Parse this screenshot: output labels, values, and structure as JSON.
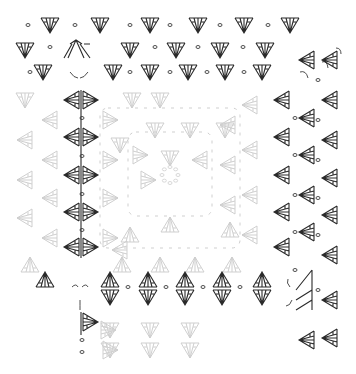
{
  "title": "",
  "chart_type": "crochet-symbol-chart",
  "symbols": {
    "shell_down": "double-crochet fan (∇ with posts)",
    "shell_up": "double-crochet fan (∆ with posts)",
    "shell_left": "fan pointing left (◁)",
    "shell_right": "fan pointing right (▷)",
    "chain": "chain stitch (small oval)",
    "cluster": "split cluster (/⋀\\)"
  },
  "colors": {
    "active": "#2a2a2a",
    "ghost": "#cfcfcf",
    "background": "#ffffff"
  },
  "glyphs": {
    "dark_down": [
      [
        50,
        25
      ],
      [
        100,
        25
      ],
      [
        150,
        25
      ],
      [
        198,
        25
      ],
      [
        244,
        25
      ],
      [
        290,
        25
      ],
      [
        25,
        50
      ],
      [
        130,
        50
      ],
      [
        176,
        50
      ],
      [
        220,
        50
      ],
      [
        265,
        50
      ],
      [
        43,
        72
      ],
      [
        113,
        72
      ],
      [
        150,
        72
      ],
      [
        188,
        72
      ],
      [
        225,
        72
      ],
      [
        262,
        72
      ],
      [
        110,
        297
      ],
      [
        148,
        297
      ],
      [
        185,
        297
      ],
      [
        222,
        297
      ],
      [
        262,
        297
      ]
    ],
    "dark_up": [
      [
        45,
        280
      ],
      [
        110,
        280
      ],
      [
        148,
        280
      ],
      [
        185,
        280
      ],
      [
        222,
        280
      ],
      [
        262,
        280
      ]
    ],
    "dark_left": [
      [
        72,
        100
      ],
      [
        72,
        137
      ],
      [
        72,
        175
      ],
      [
        72,
        212
      ],
      [
        72,
        247
      ],
      [
        282,
        100
      ],
      [
        282,
        137
      ],
      [
        282,
        175
      ],
      [
        282,
        212
      ],
      [
        282,
        247
      ],
      [
        307,
        60
      ],
      [
        307,
        118
      ],
      [
        307,
        155
      ],
      [
        307,
        195
      ],
      [
        307,
        232
      ],
      [
        307,
        340
      ],
      [
        330,
        60
      ],
      [
        330,
        100
      ],
      [
        330,
        140
      ],
      [
        330,
        178
      ],
      [
        330,
        215
      ],
      [
        330,
        255
      ],
      [
        330,
        300
      ],
      [
        330,
        338
      ]
    ],
    "dark_right": [
      [
        90,
        100
      ],
      [
        90,
        137
      ],
      [
        90,
        175
      ],
      [
        90,
        212
      ],
      [
        90,
        247
      ],
      [
        90,
        322
      ]
    ],
    "dark_dots": [
      [
        28,
        25
      ],
      [
        75,
        25
      ],
      [
        130,
        25
      ],
      [
        170,
        25
      ],
      [
        220,
        25
      ],
      [
        268,
        25
      ],
      [
        50,
        47
      ],
      [
        155,
        47
      ],
      [
        198,
        47
      ],
      [
        243,
        47
      ],
      [
        30,
        72
      ],
      [
        130,
        72
      ],
      [
        170,
        72
      ],
      [
        207,
        72
      ],
      [
        244,
        72
      ],
      [
        82,
        118
      ],
      [
        82,
        156
      ],
      [
        82,
        194
      ],
      [
        82,
        230
      ],
      [
        128,
        287
      ],
      [
        166,
        287
      ],
      [
        203,
        287
      ],
      [
        240,
        287
      ],
      [
        295,
        118
      ],
      [
        295,
        155
      ],
      [
        295,
        195
      ],
      [
        295,
        232
      ],
      [
        295,
        270
      ],
      [
        318,
        80
      ],
      [
        318,
        120
      ],
      [
        318,
        160
      ],
      [
        318,
        198
      ],
      [
        318,
        235
      ],
      [
        318,
        290
      ],
      [
        82,
        340
      ],
      [
        82,
        352
      ]
    ],
    "faint_down": [
      [
        25,
        100
      ],
      [
        132,
        100
      ],
      [
        160,
        100
      ],
      [
        120,
        145
      ],
      [
        155,
        130
      ],
      [
        190,
        130
      ],
      [
        225,
        130
      ],
      [
        170,
        158
      ],
      [
        110,
        350
      ],
      [
        150,
        350
      ],
      [
        190,
        350
      ],
      [
        110,
        330
      ],
      [
        150,
        330
      ],
      [
        190,
        330
      ]
    ],
    "faint_up": [
      [
        30,
        265
      ],
      [
        122,
        265
      ],
      [
        160,
        265
      ],
      [
        195,
        265
      ],
      [
        232,
        265
      ],
      [
        130,
        235
      ],
      [
        170,
        225
      ],
      [
        230,
        230
      ]
    ],
    "faint_left": [
      [
        25,
        140
      ],
      [
        25,
        180
      ],
      [
        25,
        218
      ],
      [
        50,
        120
      ],
      [
        50,
        160
      ],
      [
        50,
        198
      ],
      [
        50,
        238
      ],
      [
        250,
        105
      ],
      [
        250,
        150
      ],
      [
        250,
        195
      ],
      [
        250,
        235
      ],
      [
        228,
        125
      ],
      [
        228,
        165
      ],
      [
        228,
        205
      ],
      [
        200,
        160
      ],
      [
        120,
        250
      ]
    ],
    "faint_right": [
      [
        110,
        120
      ],
      [
        110,
        160
      ],
      [
        110,
        198
      ],
      [
        110,
        238
      ],
      [
        140,
        155
      ],
      [
        148,
        180
      ],
      [
        110,
        350
      ],
      [
        108,
        330
      ]
    ],
    "center_ring": [
      170,
      175
    ]
  }
}
